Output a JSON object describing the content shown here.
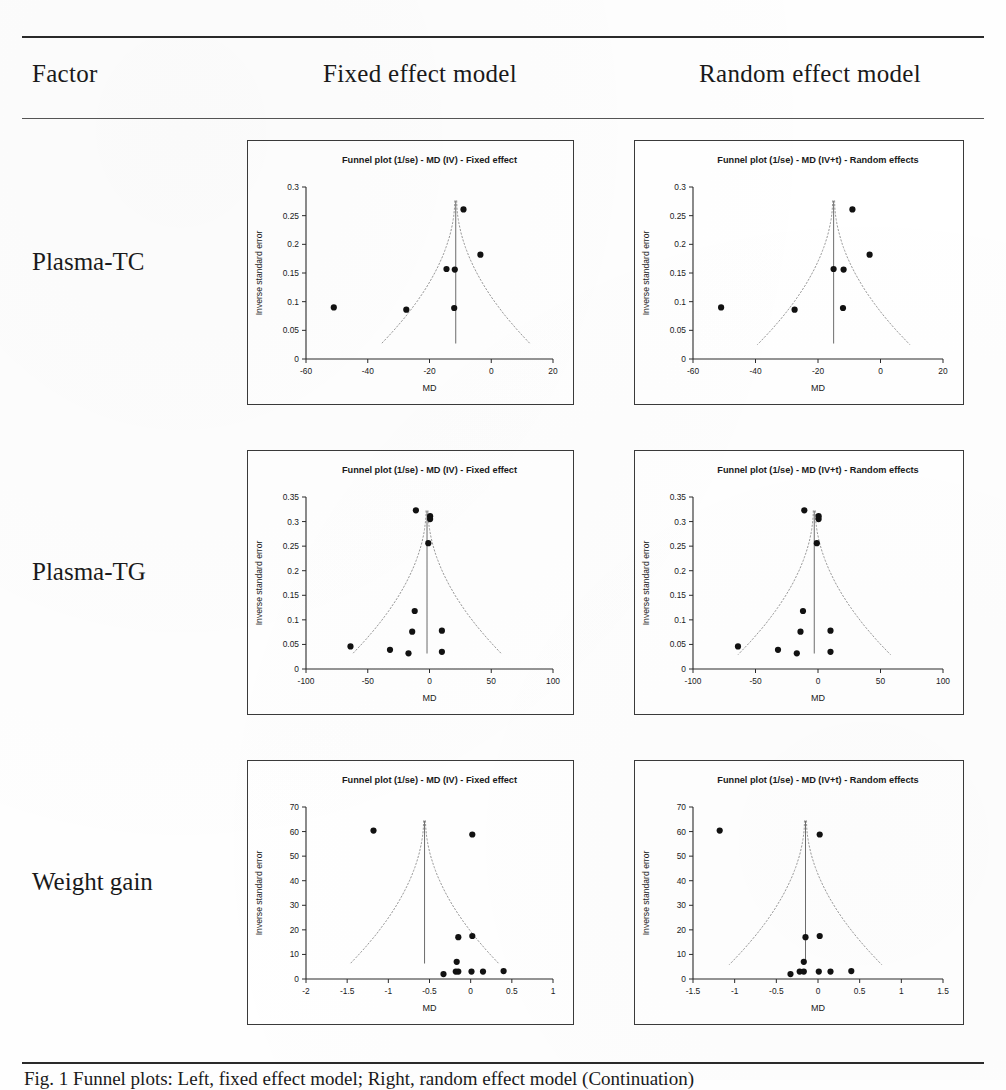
{
  "table": {
    "headers": {
      "factor": "Factor",
      "fixed": "Fixed effect model",
      "random": "Random effect model"
    },
    "row_labels": [
      "Plasma-TC",
      "Plasma-TG",
      "Weight gain"
    ]
  },
  "caption": "Fig. 1 Funnel plots: Left, fixed effect model; Right, random effect model (Continuation)",
  "common": {
    "ylabel": "Inverse standard error",
    "xlabel": "MD",
    "title_fixed": "Funnel plot (1/se) - MD (IV) - Fixed effect",
    "title_random": "Funnel plot (1/se) - MD (IV+t) - Random effects",
    "marker_color": "#111111",
    "funnel_color": "#9a9a9a",
    "axis_color": "#2b2b2b"
  },
  "chart_data": [
    {
      "id": "plasma-tc-fixed",
      "type": "scatter",
      "row": "Plasma-TC",
      "model": "Fixed effect model",
      "title": "Funnel plot (1/se) - MD (IV) - Fixed effect",
      "xlabel": "MD",
      "ylabel": "Inverse standard error",
      "xlim": [
        -60,
        20
      ],
      "ylim": [
        0,
        0.3
      ],
      "xticks": [
        -60,
        -40,
        -20,
        0,
        20
      ],
      "yticks": [
        0,
        0.05,
        0.1,
        0.15,
        0.2,
        0.25,
        0.3
      ],
      "grid": false,
      "pooled_effect_x": -11.5,
      "points": [
        {
          "x": -51.0,
          "y": 0.09
        },
        {
          "x": -27.5,
          "y": 0.086
        },
        {
          "x": -14.5,
          "y": 0.157
        },
        {
          "x": -11.8,
          "y": 0.156
        },
        {
          "x": -12.0,
          "y": 0.089
        },
        {
          "x": -9.0,
          "y": 0.261
        },
        {
          "x": -3.5,
          "y": 0.182
        }
      ]
    },
    {
      "id": "plasma-tc-random",
      "type": "scatter",
      "row": "Plasma-TC",
      "model": "Random effect model",
      "title": "Funnel plot (1/se) - MD (IV+t) - Random effects",
      "xlabel": "MD",
      "ylabel": "Inverse standard error",
      "xlim": [
        -60,
        20
      ],
      "ylim": [
        0,
        0.3
      ],
      "xticks": [
        -60,
        -40,
        -20,
        0,
        20
      ],
      "yticks": [
        0,
        0.05,
        0.1,
        0.15,
        0.2,
        0.25,
        0.3
      ],
      "grid": false,
      "pooled_effect_x": -15.0,
      "points": [
        {
          "x": -51.0,
          "y": 0.09
        },
        {
          "x": -27.5,
          "y": 0.086
        },
        {
          "x": -15.0,
          "y": 0.157
        },
        {
          "x": -11.8,
          "y": 0.156
        },
        {
          "x": -12.0,
          "y": 0.089
        },
        {
          "x": -9.0,
          "y": 0.261
        },
        {
          "x": -3.5,
          "y": 0.182
        }
      ]
    },
    {
      "id": "plasma-tg-fixed",
      "type": "scatter",
      "row": "Plasma-TG",
      "model": "Fixed effect model",
      "title": "Funnel plot (1/se) - MD (IV) - Fixed effect",
      "xlabel": "MD",
      "ylabel": "Inverse standard error",
      "xlim": [
        -100,
        100
      ],
      "ylim": [
        0,
        0.35
      ],
      "xticks": [
        -100,
        -50,
        0,
        50,
        100
      ],
      "yticks": [
        0,
        0.05,
        0.1,
        0.15,
        0.2,
        0.25,
        0.3,
        0.35
      ],
      "grid": false,
      "pooled_effect_x": -2.0,
      "points": [
        {
          "x": -11.0,
          "y": 0.323
        },
        {
          "x": 0.5,
          "y": 0.311
        },
        {
          "x": 0.5,
          "y": 0.305
        },
        {
          "x": -1.0,
          "y": 0.256
        },
        {
          "x": -12.0,
          "y": 0.118
        },
        {
          "x": -14.0,
          "y": 0.076
        },
        {
          "x": 10.0,
          "y": 0.078
        },
        {
          "x": -64.0,
          "y": 0.046
        },
        {
          "x": -32.0,
          "y": 0.039
        },
        {
          "x": -17.0,
          "y": 0.032
        },
        {
          "x": 10.0,
          "y": 0.035
        }
      ]
    },
    {
      "id": "plasma-tg-random",
      "type": "scatter",
      "row": "Plasma-TG",
      "model": "Random effect model",
      "title": "Funnel plot (1/se) - MD (IV+t) - Random effects",
      "xlabel": "MD",
      "ylabel": "Inverse standard error",
      "xlim": [
        -100,
        100
      ],
      "ylim": [
        0,
        0.35
      ],
      "xticks": [
        -100,
        -50,
        0,
        50,
        100
      ],
      "yticks": [
        0,
        0.05,
        0.1,
        0.15,
        0.2,
        0.25,
        0.3,
        0.35
      ],
      "grid": false,
      "pooled_effect_x": -3.0,
      "points": [
        {
          "x": -11.0,
          "y": 0.323
        },
        {
          "x": 0.5,
          "y": 0.311
        },
        {
          "x": 0.5,
          "y": 0.305
        },
        {
          "x": -1.0,
          "y": 0.256
        },
        {
          "x": -12.0,
          "y": 0.118
        },
        {
          "x": -14.0,
          "y": 0.076
        },
        {
          "x": 10.0,
          "y": 0.078
        },
        {
          "x": -64.0,
          "y": 0.046
        },
        {
          "x": -32.0,
          "y": 0.039
        },
        {
          "x": -17.0,
          "y": 0.032
        },
        {
          "x": 10.0,
          "y": 0.035
        }
      ]
    },
    {
      "id": "weight-gain-fixed",
      "type": "scatter",
      "row": "Weight gain",
      "model": "Fixed effect model",
      "title": "Funnel plot (1/se) - MD (IV) - Fixed effect",
      "xlabel": "MD",
      "ylabel": "Inverse standard error",
      "xlim": [
        -2,
        1
      ],
      "ylim": [
        0,
        70
      ],
      "xticks": [
        -2,
        -1.5,
        -1,
        -0.5,
        0,
        0.5,
        1
      ],
      "yticks": [
        0,
        10,
        20,
        30,
        40,
        50,
        60,
        70
      ],
      "grid": false,
      "pooled_effect_x": -0.56,
      "points": [
        {
          "x": -1.18,
          "y": 60.4
        },
        {
          "x": 0.02,
          "y": 58.8
        },
        {
          "x": -0.15,
          "y": 17.0
        },
        {
          "x": 0.02,
          "y": 17.5
        },
        {
          "x": -0.17,
          "y": 7.0
        },
        {
          "x": -0.33,
          "y": 2.0
        },
        {
          "x": -0.18,
          "y": 3.0
        },
        {
          "x": -0.15,
          "y": 3.0
        },
        {
          "x": 0.01,
          "y": 3.0
        },
        {
          "x": 0.15,
          "y": 3.0
        },
        {
          "x": 0.4,
          "y": 3.2
        }
      ]
    },
    {
      "id": "weight-gain-random",
      "type": "scatter",
      "row": "Weight gain",
      "model": "Random effect model",
      "title": "Funnel plot (1/se) - MD (IV+t) - Random effects",
      "xlabel": "MD",
      "ylabel": "Inverse standard error",
      "xlim": [
        -1.5,
        1.5
      ],
      "ylim": [
        0,
        70
      ],
      "xticks": [
        -1.5,
        -1,
        -0.5,
        0,
        0.5,
        1,
        1.5
      ],
      "yticks": [
        0,
        10,
        20,
        30,
        40,
        50,
        60,
        70
      ],
      "grid": false,
      "pooled_effect_x": -0.15,
      "points": [
        {
          "x": -1.18,
          "y": 60.4
        },
        {
          "x": 0.02,
          "y": 58.8
        },
        {
          "x": -0.15,
          "y": 17.0
        },
        {
          "x": 0.02,
          "y": 17.5
        },
        {
          "x": -0.17,
          "y": 7.0
        },
        {
          "x": -0.33,
          "y": 2.0
        },
        {
          "x": -0.22,
          "y": 3.0
        },
        {
          "x": -0.17,
          "y": 3.0
        },
        {
          "x": 0.01,
          "y": 3.0
        },
        {
          "x": 0.15,
          "y": 3.0
        },
        {
          "x": 0.4,
          "y": 3.2
        }
      ]
    }
  ]
}
